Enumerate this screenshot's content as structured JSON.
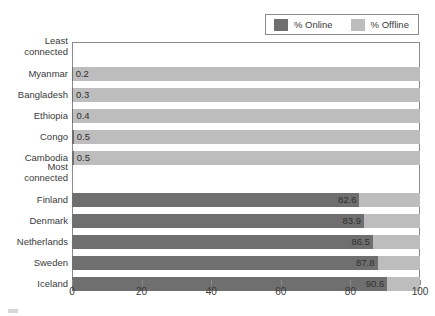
{
  "chart_data": {
    "type": "bar",
    "orientation": "horizontal",
    "stacked": true,
    "title": "",
    "subtitle": "",
    "xlabel": "",
    "ylabel": "",
    "xlim": [
      0,
      100
    ],
    "xticks": [
      0,
      20,
      40,
      60,
      80,
      100
    ],
    "xticklabels": [
      "0",
      "20",
      "40",
      "60",
      "80",
      "100"
    ],
    "grid": false,
    "legend_position": "top-right",
    "legend": [
      {
        "name": "% Online",
        "color": "#6f6f6f"
      },
      {
        "name": "% Offline",
        "color": "#bdbdbd"
      }
    ],
    "series": [
      {
        "name": "% Online",
        "color": "#6f6f6f",
        "values": [
          0.2,
          0.3,
          0.4,
          0.5,
          0.5,
          null,
          82.6,
          83.9,
          86.5,
          87.8,
          90.6
        ]
      },
      {
        "name": "% Offline",
        "color": "#bdbdbd",
        "values": [
          99.8,
          99.7,
          99.6,
          99.5,
          99.5,
          null,
          17.4,
          16.1,
          13.5,
          12.2,
          9.4
        ]
      }
    ],
    "categories": [
      "Myanmar",
      "Bangladesh",
      "Ethiopia",
      "Congo",
      "Cambodia",
      "Most connected",
      "Finland",
      "Denmark",
      "Netherlands",
      "Sweden",
      "Iceland"
    ],
    "group_headers": [
      "Least connected",
      "Most connected"
    ],
    "rows": [
      {
        "label": "Least connected",
        "kind": "group-header",
        "two_line": true,
        "line1": "Least",
        "line2": "connected",
        "online": null,
        "offline": null,
        "value_label": null
      },
      {
        "label": "Myanmar",
        "kind": "bar",
        "two_line": false,
        "online": 0.2,
        "offline": 99.8,
        "value_label": "0.2",
        "label_side": "left"
      },
      {
        "label": "Bangladesh",
        "kind": "bar",
        "two_line": false,
        "online": 0.3,
        "offline": 99.7,
        "value_label": "0.3",
        "label_side": "left"
      },
      {
        "label": "Ethiopia",
        "kind": "bar",
        "two_line": false,
        "online": 0.4,
        "offline": 99.6,
        "value_label": "0.4",
        "label_side": "left"
      },
      {
        "label": "Congo",
        "kind": "bar",
        "two_line": false,
        "online": 0.5,
        "offline": 99.5,
        "value_label": "0.5",
        "label_side": "left"
      },
      {
        "label": "Cambodia",
        "kind": "bar",
        "two_line": false,
        "online": 0.5,
        "offline": 99.5,
        "value_label": "0.5",
        "label_side": "left"
      },
      {
        "label": "Most connected",
        "kind": "group-header",
        "two_line": true,
        "line1": "Most",
        "line2": "connected",
        "online": null,
        "offline": null,
        "value_label": null
      },
      {
        "label": "Finland",
        "kind": "bar",
        "two_line": false,
        "online": 82.6,
        "offline": 17.4,
        "value_label": "82.6",
        "label_side": "right"
      },
      {
        "label": "Denmark",
        "kind": "bar",
        "two_line": false,
        "online": 83.9,
        "offline": 16.1,
        "value_label": "83.9",
        "label_side": "right"
      },
      {
        "label": "Netherlands",
        "kind": "bar",
        "two_line": false,
        "online": 86.5,
        "offline": 13.5,
        "value_label": "86.5",
        "label_side": "right"
      },
      {
        "label": "Sweden",
        "kind": "bar",
        "two_line": false,
        "online": 87.8,
        "offline": 12.2,
        "value_label": "87.8",
        "label_side": "right"
      },
      {
        "label": "Iceland",
        "kind": "bar",
        "two_line": false,
        "online": 90.6,
        "offline": 9.4,
        "value_label": "90.6",
        "label_side": "right"
      }
    ]
  },
  "colors": {
    "online": "#6f6f6f",
    "offline": "#bdbdbd",
    "axis": "#8a8a8a",
    "text": "#3a3a3a",
    "background": "#ffffff"
  },
  "caption": {
    "text": ""
  }
}
